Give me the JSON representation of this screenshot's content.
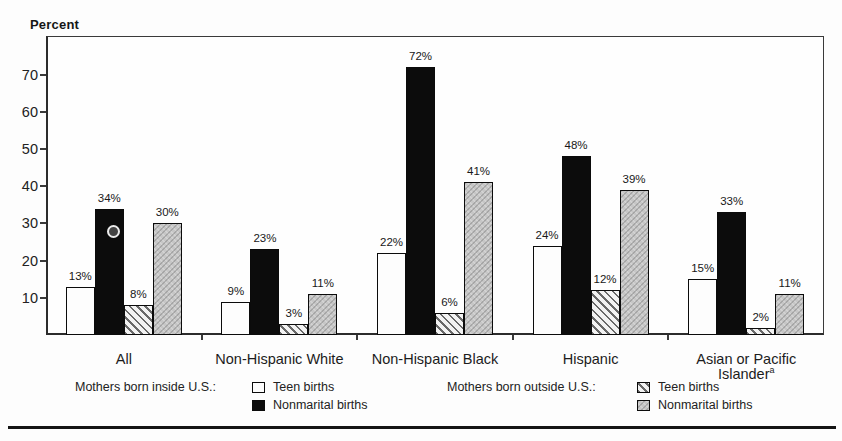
{
  "page": {
    "background": "#fdfdfd"
  },
  "chart_data": {
    "type": "bar",
    "title": "",
    "y_axis_title": "Percent",
    "value_suffix": "%",
    "ylim": [
      0,
      80
    ],
    "yticks": [
      10,
      20,
      30,
      40,
      50,
      60,
      70
    ],
    "grid": false,
    "legend_position": "bottom",
    "categories": [
      {
        "lines": [
          "All"
        ]
      },
      {
        "lines": [
          "Non-Hispanic White"
        ]
      },
      {
        "lines": [
          "Non-Hispanic Black"
        ]
      },
      {
        "lines": [
          "Hispanic"
        ]
      },
      {
        "lines": [
          "Asian or Pacific",
          "Islander"
        ],
        "superscript": "a"
      }
    ],
    "series": [
      {
        "name": "Teen births (mothers born inside U.S.)",
        "style": "teen-inside",
        "values": [
          13,
          9,
          22,
          24,
          15
        ]
      },
      {
        "name": "Nonmarital births (mothers born inside U.S.)",
        "style": "nonmarital-inside",
        "values": [
          34,
          23,
          72,
          48,
          33
        ]
      },
      {
        "name": "Teen births (mothers born outside U.S.)",
        "style": "teen-outside",
        "values": [
          8,
          3,
          6,
          12,
          2
        ]
      },
      {
        "name": "Nonmarital births (mothers born outside U.S.)",
        "style": "nonmarital-outside",
        "values": [
          30,
          11,
          41,
          39,
          11
        ]
      }
    ]
  },
  "legend": {
    "inside": {
      "label": "Mothers born inside U.S.:",
      "items": [
        {
          "label": "Teen births",
          "style": "teen-inside"
        },
        {
          "label": "Nonmarital births",
          "style": "nonmarital-inside"
        }
      ]
    },
    "outside": {
      "label": "Mothers born outside U.S.:",
      "items": [
        {
          "label": "Teen births",
          "style": "teen-outside"
        },
        {
          "label": "Nonmarital births",
          "style": "nonmarital-outside"
        }
      ]
    }
  }
}
